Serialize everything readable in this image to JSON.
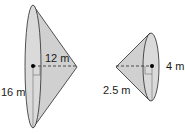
{
  "diagram": {
    "left_cone": {
      "height_label": "12 m",
      "diameter_label": "16 m"
    },
    "right_cone": {
      "radius_label": "4 m",
      "slant_label": "2.5 m"
    },
    "colors": {
      "fill": "#d4d4d4",
      "stroke": "#2a2a2a"
    }
  }
}
